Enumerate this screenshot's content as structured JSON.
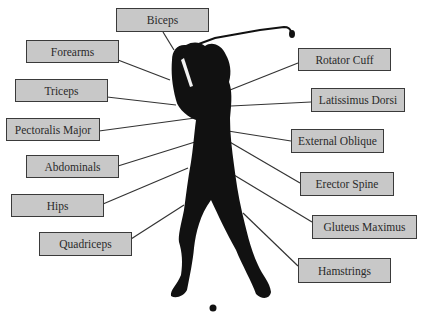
{
  "diagram": {
    "colors": {
      "box_fill": "#c8c8c8",
      "box_border": "#3a3a3a",
      "silhouette": "#111111",
      "leader_line": "#333333"
    },
    "labels_left": [
      {
        "id": "biceps",
        "text": "Biceps"
      },
      {
        "id": "forearms",
        "text": "Forearms"
      },
      {
        "id": "triceps",
        "text": "Triceps"
      },
      {
        "id": "pectoralis-major",
        "text": "Pectoralis Major"
      },
      {
        "id": "abdominals",
        "text": "Abdominals"
      },
      {
        "id": "hips",
        "text": "Hips"
      },
      {
        "id": "quadriceps",
        "text": "Quadriceps"
      }
    ],
    "labels_right": [
      {
        "id": "rotator-cuff",
        "text": "Rotator Cuff"
      },
      {
        "id": "latissimus-dorsi",
        "text": "Latissimus Dorsi"
      },
      {
        "id": "external-oblique",
        "text": "External Oblique"
      },
      {
        "id": "erector-spine",
        "text": "Erector Spine"
      },
      {
        "id": "gluteus-maximus",
        "text": "Gluteus Maximus"
      },
      {
        "id": "hamstrings",
        "text": "Hamstrings"
      }
    ]
  }
}
